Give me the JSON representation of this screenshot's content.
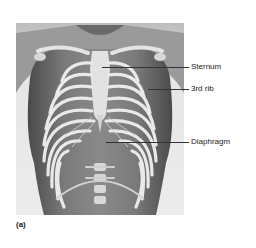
{
  "figure": {
    "panel_letter": "(a)",
    "labels": [
      {
        "id": "sternum",
        "text": "Sternum",
        "line_y": 67,
        "line_x1": 102,
        "line_x2": 189,
        "text_x": 191,
        "text_y": 63
      },
      {
        "id": "third-rib",
        "text": "3rd rib",
        "line_y": 89,
        "line_x1": 148,
        "line_x2": 189,
        "text_x": 191,
        "text_y": 85
      },
      {
        "id": "diaphragm",
        "text": "Diaphragm",
        "line_y": 142,
        "line_x1": 106,
        "line_x2": 189,
        "text_x": 191,
        "text_y": 138
      }
    ],
    "colors": {
      "background": "#ffffff",
      "panel_bg": "#dcdcdc",
      "skin_dark": "#5a5a5a",
      "skin_mid": "#808080",
      "bone": "#e8e8e8",
      "leader": "#333333",
      "text": "#222222"
    }
  }
}
